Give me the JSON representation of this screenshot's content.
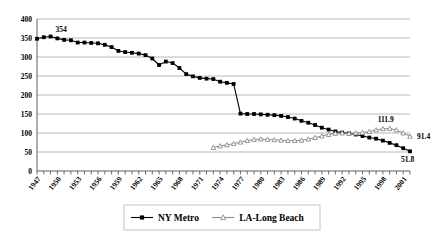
{
  "chart_data": {
    "type": "line",
    "title": "",
    "xlabel": "",
    "ylabel": "",
    "ylim": [
      0,
      400
    ],
    "ytick_step": 50,
    "yticks": [
      "0",
      "50",
      "100",
      "150",
      "200",
      "250",
      "300",
      "350",
      "400"
    ],
    "grid": true,
    "legend_position": "bottom-center",
    "x": [
      1947,
      1948,
      1949,
      1950,
      1951,
      1952,
      1953,
      1954,
      1955,
      1956,
      1957,
      1958,
      1959,
      1960,
      1961,
      1962,
      1963,
      1964,
      1965,
      1966,
      1967,
      1968,
      1969,
      1970,
      1971,
      1972,
      1973,
      1974,
      1975,
      1976,
      1977,
      1978,
      1979,
      1980,
      1981,
      1982,
      1983,
      1984,
      1985,
      1986,
      1987,
      1988,
      1989,
      1990,
      1991,
      1992,
      1993,
      1994,
      1995,
      1996,
      1997,
      1998,
      1999,
      2000,
      2001,
      2002
    ],
    "xtick_labels": [
      "1947",
      "1950",
      "1953",
      "1956",
      "1959",
      "1962",
      "1965",
      "1968",
      "1971",
      "1974",
      "1977",
      "1980",
      "1983",
      "1986",
      "1989",
      "1992",
      "1995",
      "1998",
      "2001"
    ],
    "xtick_step": 3,
    "series": [
      {
        "name": "NY Metro",
        "color": "#000000",
        "marker": "square",
        "values": [
          348,
          352,
          354,
          349,
          345,
          344,
          338,
          338,
          337,
          336,
          332,
          326,
          316,
          313,
          311,
          309,
          305,
          296,
          279,
          288,
          284,
          271,
          255,
          249,
          245,
          243,
          242,
          235,
          232,
          229,
          151,
          150,
          150,
          149,
          148,
          147,
          145,
          142,
          138,
          132,
          127,
          121,
          114,
          109,
          104,
          101,
          99,
          96,
          92,
          88,
          85,
          80,
          74,
          68,
          60,
          51.8
        ]
      },
      {
        "name": "LA-Long Beach",
        "color": "#8c8c8c",
        "marker": "triangle",
        "values": [
          null,
          null,
          null,
          null,
          null,
          null,
          null,
          null,
          null,
          null,
          null,
          null,
          null,
          null,
          null,
          null,
          null,
          null,
          null,
          null,
          null,
          null,
          null,
          null,
          null,
          null,
          62,
          66,
          69,
          72,
          76,
          80,
          83,
          84,
          83,
          82,
          81,
          80,
          80,
          81,
          84,
          88,
          92,
          96,
          99,
          100,
          99,
          100,
          101,
          104,
          108,
          111,
          111.9,
          108,
          100,
          91.4
        ]
      }
    ],
    "annotations": [
      {
        "text": "354",
        "series": "NY Metro",
        "x": 1949,
        "y": 354
      },
      {
        "text": "111.9",
        "series": "LA-Long Beach",
        "x": 1999,
        "y": 111.9
      },
      {
        "text": "91.4",
        "series": "LA-Long Beach",
        "x": 2002,
        "y": 91.4
      },
      {
        "text": "51.8",
        "series": "NY Metro",
        "x": 2002,
        "y": 51.8
      }
    ]
  },
  "legend": {
    "items": [
      {
        "label": "NY Metro",
        "marker": "square",
        "color": "#000000"
      },
      {
        "label": "LA-Long Beach",
        "marker": "triangle",
        "color": "#8c8c8c"
      }
    ]
  }
}
